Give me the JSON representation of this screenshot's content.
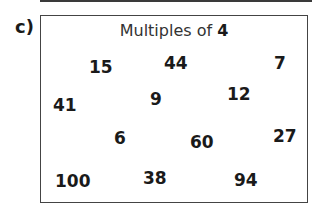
{
  "question_label": "c)",
  "box": {
    "title_text": "Multiples of ",
    "title_number": "4"
  },
  "numbers": [
    {
      "value": "15",
      "x": 89,
      "y": 57
    },
    {
      "value": "44",
      "x": 164,
      "y": 53
    },
    {
      "value": "7",
      "x": 274,
      "y": 53
    },
    {
      "value": "41",
      "x": 53,
      "y": 95
    },
    {
      "value": "9",
      "x": 150,
      "y": 89
    },
    {
      "value": "12",
      "x": 227,
      "y": 84
    },
    {
      "value": "6",
      "x": 114,
      "y": 128
    },
    {
      "value": "60",
      "x": 190,
      "y": 132
    },
    {
      "value": "27",
      "x": 273,
      "y": 126
    },
    {
      "value": "100",
      "x": 55,
      "y": 171
    },
    {
      "value": "38",
      "x": 143,
      "y": 168
    },
    {
      "value": "94",
      "x": 234,
      "y": 170
    }
  ]
}
